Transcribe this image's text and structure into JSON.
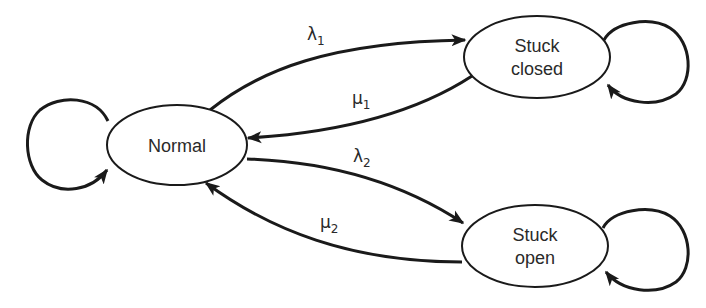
{
  "diagram": {
    "type": "state-transition",
    "states": [
      {
        "id": "normal",
        "label_lines": [
          "Normal"
        ]
      },
      {
        "id": "stuck_closed",
        "label_lines": [
          "Stuck",
          "closed"
        ]
      },
      {
        "id": "stuck_open",
        "label_lines": [
          "Stuck",
          "open"
        ]
      }
    ],
    "transitions": [
      {
        "from": "normal",
        "to": "stuck_closed",
        "symbol": "λ",
        "subscript": "1"
      },
      {
        "from": "stuck_closed",
        "to": "normal",
        "symbol": "μ",
        "subscript": "1"
      },
      {
        "from": "normal",
        "to": "stuck_open",
        "symbol": "λ",
        "subscript": "2"
      },
      {
        "from": "stuck_open",
        "to": "normal",
        "symbol": "μ",
        "subscript": "2"
      }
    ],
    "self_loops": [
      "normal",
      "stuck_closed",
      "stuck_open"
    ],
    "colors": {
      "stroke": "#1a1a1a",
      "text": "#2a2a2a",
      "background": "#ffffff"
    }
  }
}
